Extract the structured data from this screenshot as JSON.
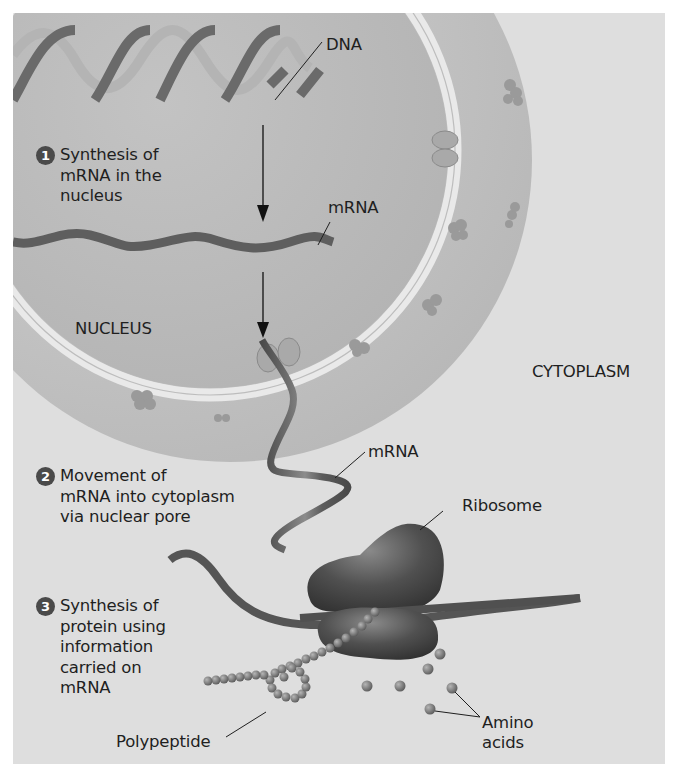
{
  "figure": {
    "regions": {
      "nucleus": "NUCLEUS",
      "cytoplasm": "CYTOPLASM"
    },
    "labels": {
      "dna": "DNA",
      "mrna_nucleus": "mRNA",
      "mrna_cytoplasm": "mRNA",
      "ribosome": "Ribosome",
      "polypeptide": "Polypeptide",
      "amino_line1": "Amino",
      "amino_line2": "acids"
    },
    "steps": [
      {
        "number": "1",
        "lines": [
          "Synthesis of",
          "mRNA in the",
          "nucleus"
        ]
      },
      {
        "number": "2",
        "lines": [
          "Movement of",
          "mRNA into cytoplasm",
          "via nuclear pore"
        ]
      },
      {
        "number": "3",
        "lines": [
          "Synthesis of",
          "protein using",
          "information",
          "carried on",
          "mRNA"
        ]
      }
    ],
    "colors": {
      "background": "#ffffff",
      "panel": "#dedede",
      "nucleus_fill": "#bdbdbd",
      "cytoplasm_ring": "#c9c9c9",
      "membrane": "#e8e8e8",
      "strand_dark": "#555555",
      "ribosome": "#4d4d4d",
      "text": "#1f1f1f"
    }
  }
}
